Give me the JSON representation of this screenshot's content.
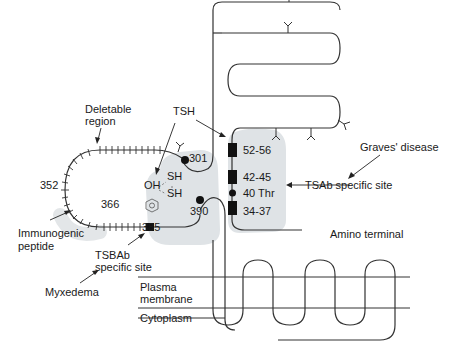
{
  "diagram": {
    "type": "TSH receptor schematic",
    "colors": {
      "line": "#333333",
      "shade": "#dfe3e6",
      "text": "#1a1a1a"
    },
    "labels": {
      "deletable_region_1": "Deletable",
      "deletable_region_2": "region",
      "tsh": "TSH",
      "n301": "301",
      "sh1": "SH",
      "sh2": "SH",
      "oh": "OH",
      "n352": "352",
      "n366": "366",
      "n385": "385",
      "n390": "390",
      "immunogenic_1": "Immunogenic",
      "immunogenic_2": "peptide",
      "tsbab_1": "TSBAb",
      "tsbab_2": "specific site",
      "myxedema": "Myxedema",
      "plasma_1": "Plasma",
      "plasma_2": "membrane",
      "cytoplasm": "Cytoplasm",
      "graves": "Graves' disease",
      "tsab": "TSAb specific site",
      "amino": "Amino terminal",
      "site_52_56": "52-56",
      "site_42_45": "42-45",
      "site_40": "40 Thr",
      "site_34_37": "34-37"
    }
  }
}
